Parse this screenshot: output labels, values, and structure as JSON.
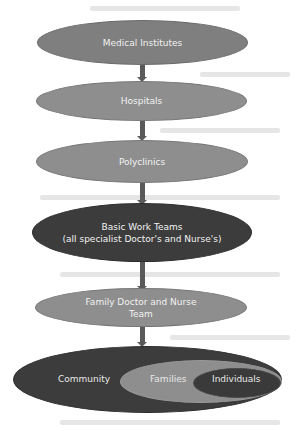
{
  "diagram": {
    "type": "hierarchy-flow",
    "nodes": [
      {
        "id": "medical-institutes",
        "label": "Medical Institutes",
        "shade": "mid"
      },
      {
        "id": "hospitals",
        "label": "Hospitals",
        "shade": "light"
      },
      {
        "id": "polyclinics",
        "label": "Polyclinics",
        "shade": "light"
      },
      {
        "id": "basic-work-teams",
        "label_line1": "Basic Work Teams",
        "label_line2": "(all specialist Doctor's and Nurse's)",
        "shade": "dark"
      },
      {
        "id": "family-doctor-nurse-team",
        "label_line1": "Family Doctor and Nurse",
        "label_line2": "Team",
        "shade": "light"
      }
    ],
    "nested": {
      "outer": {
        "label": "Community",
        "color": "#3c3c3c"
      },
      "middle": {
        "label": "Families",
        "color": "#8e8e8e"
      },
      "inner": {
        "label": "Individuals",
        "color": "#3c3c3c"
      }
    },
    "edges": [
      [
        "medical-institutes",
        "hospitals"
      ],
      [
        "hospitals",
        "polyclinics"
      ],
      [
        "polyclinics",
        "basic-work-teams"
      ],
      [
        "basic-work-teams",
        "family-doctor-nurse-team"
      ],
      [
        "family-doctor-nurse-team",
        "community"
      ]
    ],
    "colors": {
      "mid": "#7f7f7f",
      "light": "#8e8e8e",
      "dark": "#3c3c3c",
      "arrow": "#5a5a5a",
      "text": "#f2f2f2"
    }
  }
}
